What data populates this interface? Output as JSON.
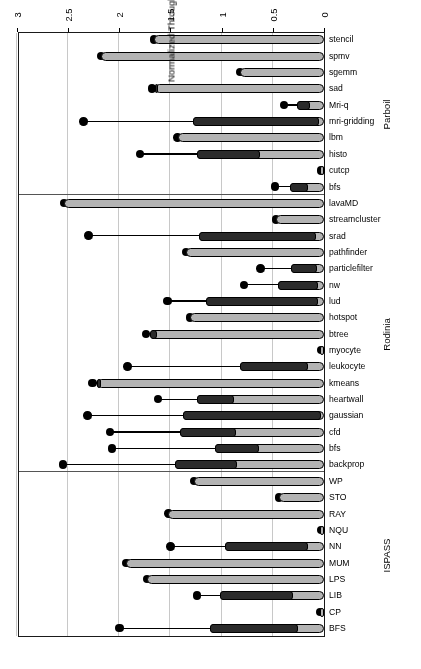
{
  "chart_data": {
    "type": "bar",
    "orientation": "horizontal",
    "title": "",
    "xlabel": "Normalized Throughput (Flits/cycle/node)",
    "ylabel": "",
    "xlim": [
      0,
      3
    ],
    "xticks": [
      "0",
      "0.5",
      "1",
      "1.5",
      "2",
      "2.5",
      "3"
    ],
    "xtick_values": [
      0,
      0.5,
      1,
      1.5,
      2,
      2.5,
      3
    ],
    "grid": "vertical",
    "legend": "none",
    "rotation_note": "figure rendered rotated 180 degrees",
    "groups": [
      {
        "name": "ISPASS",
        "categories": [
          "BFS",
          "CP",
          "LIB",
          "LPS",
          "MUM",
          "NN",
          "NQU",
          "RAY",
          "STO",
          "WP"
        ],
        "series": [
          {
            "name": "outer-bar",
            "values": [
              0.22,
              0.04,
              0.27,
              1.73,
              1.93,
              0.12,
              0.03,
              1.52,
              0.44,
              1.27
            ]
          },
          {
            "name": "inner-bar-start",
            "values": [
              0.25,
              0.04,
              0.3,
              1.73,
              1.93,
              0.16,
              0.03,
              1.52,
              0.44,
              1.27
            ]
          },
          {
            "name": "inner-bar-end",
            "values": [
              1.11,
              0.04,
              1.02,
              1.73,
              1.93,
              0.97,
              0.03,
              1.52,
              0.44,
              1.27
            ]
          },
          {
            "name": "whisker-end",
            "values": [
              2.0,
              0.04,
              1.24,
              1.73,
              1.93,
              1.5,
              0.03,
              1.52,
              0.44,
              1.27
            ]
          }
        ]
      },
      {
        "name": "Rodinia",
        "categories": [
          "backprop",
          "bfs",
          "cfd",
          "gaussian",
          "heartwall",
          "kmeans",
          "leukocyte",
          "myocyte",
          "btree",
          "hotspot",
          "lud",
          "nw",
          "particlefilter",
          "pathfinder",
          "srad",
          "streamcluster",
          "lavaMD"
        ],
        "series": [
          {
            "name": "outer-bar",
            "values": [
              0.81,
              0.6,
              0.82,
              0.03,
              0.84,
              2.14,
              0.13,
              0.03,
              1.6,
              1.31,
              0.04,
              0.04,
              0.04,
              1.35,
              0.05,
              0.47,
              2.54
            ]
          },
          {
            "name": "inner-bar-start",
            "values": [
              0.85,
              0.64,
              0.86,
              0.03,
              0.88,
              2.18,
              0.16,
              0.03,
              1.63,
              1.31,
              0.06,
              0.06,
              0.07,
              1.35,
              0.08,
              0.47,
              2.54
            ]
          },
          {
            "name": "inner-bar-end",
            "values": [
              1.46,
              1.07,
              1.41,
              1.38,
              1.24,
              2.22,
              0.82,
              0.03,
              1.7,
              1.31,
              1.15,
              0.45,
              0.32,
              1.35,
              1.22,
              0.47,
              2.54
            ]
          },
          {
            "name": "whisker-end",
            "values": [
              2.55,
              2.07,
              2.09,
              2.31,
              1.62,
              2.26,
              1.92,
              0.03,
              1.74,
              1.31,
              1.53,
              0.78,
              0.62,
              1.35,
              2.3,
              0.47,
              2.54
            ]
          }
        ]
      },
      {
        "name": "Parboil",
        "categories": [
          "bfs",
          "cutcp",
          "histo",
          "lbm",
          "mri-gridding",
          "Mri-q",
          "sad",
          "sgemm",
          "spmv",
          "stencil"
        ],
        "series": [
          {
            "name": "outer-bar",
            "values": [
              0.13,
              0.03,
              0.6,
              1.43,
              0.03,
              0.11,
              1.59,
              0.82,
              2.18,
              1.66
            ]
          },
          {
            "name": "inner-bar-start",
            "values": [
              0.16,
              0.03,
              0.63,
              1.43,
              0.05,
              0.14,
              1.62,
              0.82,
              2.18,
              1.66
            ]
          },
          {
            "name": "inner-bar-end",
            "values": [
              0.33,
              0.03,
              1.24,
              1.43,
              1.28,
              0.26,
              1.65,
              0.82,
              2.18,
              1.66
            ]
          },
          {
            "name": "whisker-end",
            "values": [
              0.48,
              0.03,
              1.8,
              1.43,
              2.35,
              0.39,
              1.68,
              0.82,
              2.18,
              1.66
            ]
          }
        ]
      }
    ]
  },
  "axis": {
    "title": "Normalized Throughput (Flits/cycle/node)",
    "ticks": [
      "0",
      "0.5",
      "1",
      "1.5",
      "2",
      "2.5",
      "3"
    ]
  },
  "group_labels": [
    "ISPASS",
    "Rodinia",
    "Parboil"
  ],
  "colors": {
    "outer_bar": "#b3b3b3",
    "inner_bar": "#2b2b2b",
    "outline": "#000000",
    "grid": "#c8c8c8",
    "frame": "#1a1a1a",
    "background": "#ffffff"
  }
}
